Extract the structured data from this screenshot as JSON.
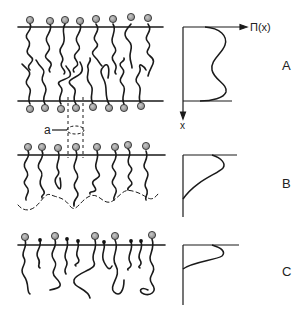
{
  "panels": [
    {
      "id": "A",
      "label": "A",
      "description": "bilayer with grafted chains, both surfaces"
    },
    {
      "id": "B",
      "label": "B",
      "description": "single layer, chains extending to dashed boundary"
    },
    {
      "id": "C",
      "label": "C",
      "description": "monolayer with mixed large and small heads"
    }
  ],
  "axis": {
    "y_label": "Π(x)",
    "x_label": "x"
  },
  "annotation": {
    "area_label": "a"
  },
  "colors": {
    "line": "#1a1a1a",
    "head_fill": "#9a9a9a",
    "small_head": "#111111",
    "background": "#ffffff"
  }
}
